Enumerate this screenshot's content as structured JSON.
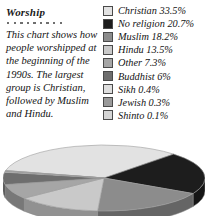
{
  "article": {
    "title": "Worship",
    "divider_dots": 9,
    "body": "This chart shows how people worshipped at the beginning of the 1990s. The largest group is Christian, followed by Muslim and Hindu."
  },
  "legend": {
    "items": [
      {
        "label": "Christian 33.5%",
        "name": "Christian",
        "value": 33.5,
        "color": "#e2e2e2"
      },
      {
        "label": "No religion 20.7%",
        "name": "No religion",
        "value": 20.7,
        "color": "#1d1d1d"
      },
      {
        "label": "Muslim 18.2%",
        "name": "Muslim",
        "value": 18.2,
        "color": "#8c8c8c"
      },
      {
        "label": "Hindu 13.5%",
        "name": "Hindu",
        "value": 13.5,
        "color": "#c9c9c9"
      },
      {
        "label": "Other 7.3%",
        "name": "Other",
        "value": 7.3,
        "color": "#a6a6a6"
      },
      {
        "label": "Buddhist 6%",
        "name": "Buddhist",
        "value": 6.0,
        "color": "#6e6e6e"
      },
      {
        "label": "Sikh 0.4%",
        "name": "Sikh",
        "value": 0.4,
        "color": "#dedede"
      },
      {
        "label": "Jewish 0.3%",
        "name": "Jewish",
        "value": 0.3,
        "color": "#9a9a9a"
      },
      {
        "label": "Shinto 0.1%",
        "name": "Shinto",
        "value": 0.1,
        "color": "#d4d4d4"
      }
    ]
  },
  "chart_data": {
    "type": "pie",
    "title": "Worship",
    "categories": [
      "Christian",
      "No religion",
      "Muslim",
      "Hindu",
      "Other",
      "Buddhist",
      "Sikh",
      "Jewish",
      "Shinto"
    ],
    "values": [
      33.5,
      20.7,
      18.2,
      13.5,
      7.3,
      6.0,
      0.4,
      0.3,
      0.1
    ],
    "unit": "%",
    "colors": [
      "#e2e2e2",
      "#1d1d1d",
      "#8c8c8c",
      "#c9c9c9",
      "#a6a6a6",
      "#6e6e6e",
      "#dedede",
      "#9a9a9a",
      "#d4d4d4"
    ],
    "legend_position": "top-right",
    "style": "3d-elliptical",
    "grid": false,
    "xlabel": "",
    "ylabel": ""
  }
}
